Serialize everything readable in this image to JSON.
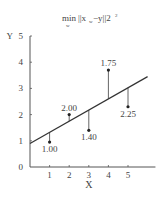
{
  "chart_data": {
    "type": "scatter",
    "title_parts": {
      "op": "min",
      "sub": "w",
      "body": "||x",
      "body_sub": "w",
      "rest": "−y||2",
      "sup": "2"
    },
    "xlabel": "X",
    "ylabel": "Y",
    "xlim": [
      0,
      6
    ],
    "ylim": [
      0,
      5
    ],
    "xticks": [
      1,
      2,
      3,
      4,
      5
    ],
    "yticks": [
      0,
      1,
      2,
      3,
      4,
      5
    ],
    "grid": false,
    "points": [
      {
        "x": 1,
        "y": 0.95,
        "label": "1.00",
        "label_pos": "below"
      },
      {
        "x": 2,
        "y": 2.0,
        "label": "2.00",
        "label_pos": "above"
      },
      {
        "x": 3,
        "y": 1.4,
        "label": "1.40",
        "label_pos": "below"
      },
      {
        "x": 4,
        "y": 3.7,
        "label": "1.75",
        "label_pos": "above"
      },
      {
        "x": 5,
        "y": 2.3,
        "label": "2.25",
        "label_pos": "below"
      }
    ],
    "fit_line": {
      "x0": 0,
      "y0": 0.9,
      "x1": 6,
      "y1": 3.45
    },
    "residual_lines": true,
    "colors": {
      "axis": "#555555",
      "line": "#333333",
      "point": "#222222",
      "text": "#444444"
    }
  }
}
